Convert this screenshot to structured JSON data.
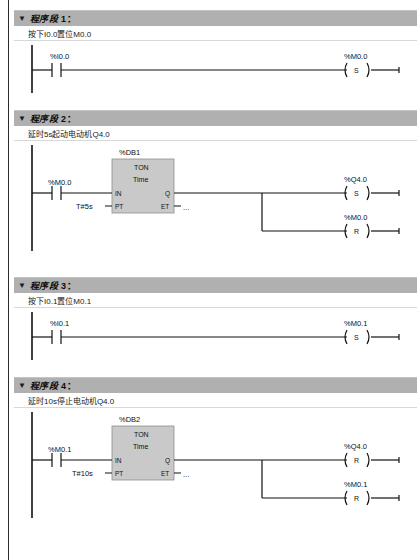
{
  "editor": {
    "title": "LAD Program Editor",
    "toggle_icon": "chevron-down-icon",
    "network_word": "程序段",
    "colon": "："
  },
  "networks": [
    {
      "number": "1",
      "title": "程序段",
      "comment": "按下I0.0置位M0.0",
      "contact": {
        "label": "%I0.0",
        "type": "NO"
      },
      "coils": [
        {
          "label": "%M0.0",
          "letter": "S"
        }
      ],
      "timer": null
    },
    {
      "number": "2",
      "title": "程序段",
      "comment": "延时5s起动电动机Q4.0",
      "contact": {
        "label": "%M0.0",
        "type": "NO"
      },
      "timer": {
        "db": "%DB1",
        "type": "TON",
        "time_base": "Time",
        "in_pin": "IN",
        "pt_pin": "PT",
        "q_pin": "Q",
        "et_pin": "ET",
        "pt_value": "T#5s",
        "et_value": "..."
      },
      "coils": [
        {
          "label": "%Q4.0",
          "letter": "S"
        },
        {
          "label": "%M0.0",
          "letter": "R"
        }
      ]
    },
    {
      "number": "3",
      "title": "程序段",
      "comment": "按下I0.1置位M0.1",
      "contact": {
        "label": "%I0.1",
        "type": "NO"
      },
      "coils": [
        {
          "label": "%M0.1",
          "letter": "S"
        }
      ],
      "timer": null
    },
    {
      "number": "4",
      "title": "程序段",
      "comment": "延时10s停止电动机Q4.0",
      "contact": {
        "label": "%M0.1",
        "type": "NO"
      },
      "timer": {
        "db": "%DB2",
        "type": "TON",
        "time_base": "Time",
        "in_pin": "IN",
        "pt_pin": "PT",
        "q_pin": "Q",
        "et_pin": "ET",
        "pt_value": "T#10s",
        "et_value": "..."
      },
      "coils": [
        {
          "label": "%Q4.0",
          "letter": "R"
        },
        {
          "label": "%M0.1",
          "letter": "R"
        }
      ]
    }
  ],
  "colors": {
    "header_bar": "#b0b0b0",
    "block_body": "#c9c9c9",
    "wire": "#111111",
    "canvas": "#ffffff"
  }
}
